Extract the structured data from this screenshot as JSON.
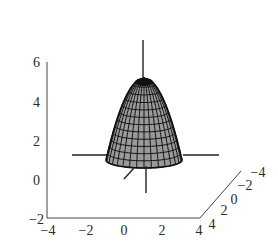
{
  "chart_data": {
    "type": "surface3d",
    "title": "",
    "surface": {
      "shape": "paraboloid",
      "apex_z": 6,
      "base_z": 0,
      "fill_color": "#9a9a9a",
      "mesh_color": "#111111",
      "mesh_radial_lines": 16,
      "mesh_rings": 12
    },
    "axes": {
      "x": {
        "label": "",
        "ticks": [
          "−4",
          "−2",
          "0",
          "2",
          "4"
        ],
        "range": [
          -4,
          4
        ]
      },
      "y": {
        "label": "",
        "ticks": [
          "4",
          "2",
          "0",
          "−2",
          "−4"
        ],
        "range": [
          -4,
          4
        ]
      },
      "z": {
        "label": "",
        "ticks": [
          "−2",
          "0",
          "2",
          "4",
          "6"
        ],
        "range": [
          -2,
          6
        ]
      }
    },
    "grid": false,
    "legend": null,
    "box": true
  }
}
